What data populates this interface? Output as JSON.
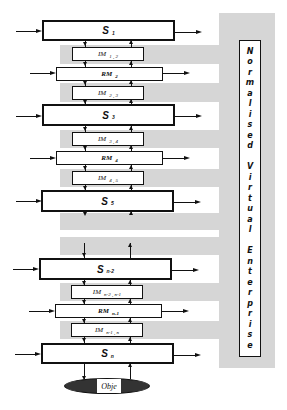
{
  "diagram": {
    "side_label": "Normalised Virtual Enterprise",
    "side_label_chars": [
      "N",
      "o",
      "r",
      "m",
      "a",
      "l",
      "i",
      "s",
      "e",
      "d",
      " ",
      "V",
      "i",
      "r",
      "t",
      "u",
      "a",
      "l",
      " ",
      "E",
      "n",
      "t",
      "e",
      "r",
      "p",
      "r",
      "i",
      "s",
      "e"
    ],
    "nodes": [
      {
        "id": "s1",
        "type": "S",
        "label": "S",
        "sub": "1"
      },
      {
        "id": "im12",
        "type": "IM",
        "label": "IM",
        "sub": "1 , 2"
      },
      {
        "id": "rm2",
        "type": "RM",
        "label": "RM",
        "sub": "2"
      },
      {
        "id": "im23",
        "type": "IM",
        "label": "IM",
        "sub": "2 , 3"
      },
      {
        "id": "s3",
        "type": "S",
        "label": "S",
        "sub": "3"
      },
      {
        "id": "im34",
        "type": "IM",
        "label": "IM",
        "sub": "3 , 4"
      },
      {
        "id": "rm4",
        "type": "RM",
        "label": "RM",
        "sub": "4"
      },
      {
        "id": "im45",
        "type": "IM",
        "label": "IM",
        "sub": "4 , 5"
      },
      {
        "id": "s5",
        "type": "S",
        "label": "S",
        "sub": "5"
      },
      {
        "id": "sn2",
        "type": "S",
        "label": "S",
        "sub": "n-2"
      },
      {
        "id": "imn2n1",
        "type": "IM",
        "label": "IM",
        "sub": "n-2 , n-1"
      },
      {
        "id": "rmn1",
        "type": "RM",
        "label": "RM",
        "sub": "n-1"
      },
      {
        "id": "imn1n",
        "type": "IM",
        "label": "IM",
        "sub": "n-1 , n"
      },
      {
        "id": "sn",
        "type": "S",
        "label": "S",
        "sub": "n"
      }
    ],
    "object_label": "Obje",
    "colors": {
      "band_gray": "#d6d6d6",
      "line": "#111111",
      "ellipse_fill": "#333333"
    }
  }
}
